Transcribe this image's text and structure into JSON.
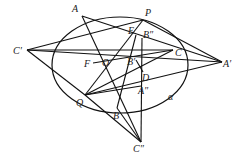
{
  "diagram": {
    "title": "",
    "stroke_color": "#111111",
    "label_color": "#222222",
    "background": "#ffffff",
    "curve": {
      "name": "ellipse",
      "label": "α"
    },
    "points": [
      {
        "id": "A",
        "label": "A"
      },
      {
        "id": "P",
        "label": "P"
      },
      {
        "id": "E",
        "label": "E"
      },
      {
        "id": "Bpp",
        "label": "B″"
      },
      {
        "id": "Cp",
        "label": "C′"
      },
      {
        "id": "C",
        "label": "C"
      },
      {
        "id": "Ap",
        "label": "A′"
      },
      {
        "id": "F",
        "label": "F"
      },
      {
        "id": "O",
        "label": "O"
      },
      {
        "id": "Bp",
        "label": "B′"
      },
      {
        "id": "D",
        "label": "D"
      },
      {
        "id": "App",
        "label": "A″"
      },
      {
        "id": "Q",
        "label": "Q"
      },
      {
        "id": "B",
        "label": "B"
      },
      {
        "id": "Cpp",
        "label": "C″"
      }
    ],
    "segments": [
      [
        "Cp",
        "P"
      ],
      [
        "Cp",
        "C"
      ],
      [
        "Cp",
        "Ap"
      ],
      [
        "Cp",
        "Q"
      ],
      [
        "P",
        "Ap"
      ],
      [
        "A",
        "Ap"
      ],
      [
        "Q",
        "Ap"
      ],
      [
        "P",
        "Q"
      ],
      [
        "A",
        "Cpp"
      ],
      [
        "Q",
        "Cpp"
      ],
      [
        "Bpp",
        "Cpp"
      ],
      [
        "B",
        "Cpp"
      ],
      [
        "Q",
        "C"
      ],
      [
        "F",
        "C"
      ],
      [
        "E",
        "B"
      ],
      [
        "Q",
        "App"
      ],
      [
        "Bp",
        "D"
      ]
    ]
  }
}
